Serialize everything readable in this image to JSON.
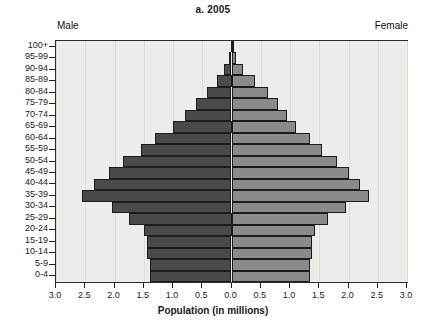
{
  "chart": {
    "title": "a. 2005",
    "male_label": "Male",
    "female_label": "Female",
    "xaxis_title": "Population (in millions)"
  },
  "chart_data": {
    "type": "bar",
    "subtype": "population-pyramid",
    "title": "a. 2005",
    "xlabel": "Population (in millions)",
    "ylabel": "",
    "xlim": [
      -3.0,
      3.0
    ],
    "grid": true,
    "legend": "none",
    "x_tick_labels": [
      "3.0",
      "2.5",
      "2.0",
      "1.5",
      "1.0",
      "0.5",
      "0.0",
      "0.5",
      "1.0",
      "1.5",
      "2.0",
      "2.5",
      "3.0"
    ],
    "x_tick_values": [
      -3.0,
      -2.5,
      -2.0,
      -1.5,
      -1.0,
      -0.5,
      0.0,
      0.5,
      1.0,
      1.5,
      2.0,
      2.5,
      3.0
    ],
    "categories": [
      "0-4",
      "5-9",
      "10-14",
      "15-19",
      "20-24",
      "25-29",
      "30-34",
      "35-39",
      "40-44",
      "45-49",
      "50-54",
      "55-59",
      "60-64",
      "65-69",
      "70-74",
      "75-79",
      "80-84",
      "85-89",
      "90-94",
      "95-99",
      "100+"
    ],
    "series": [
      {
        "name": "Male",
        "side": "left",
        "color": "#4a4a4a",
        "values": [
          1.4,
          1.4,
          1.45,
          1.45,
          1.5,
          1.75,
          2.05,
          2.55,
          2.35,
          2.1,
          1.85,
          1.55,
          1.3,
          1.0,
          0.8,
          0.6,
          0.42,
          0.25,
          0.12,
          0.04,
          0.01
        ]
      },
      {
        "name": "Female",
        "side": "right",
        "color": "#8a8a8a",
        "values": [
          1.35,
          1.35,
          1.38,
          1.38,
          1.42,
          1.65,
          1.95,
          2.35,
          2.2,
          2.0,
          1.8,
          1.55,
          1.35,
          1.1,
          0.95,
          0.8,
          0.62,
          0.4,
          0.2,
          0.07,
          0.02
        ]
      }
    ]
  }
}
